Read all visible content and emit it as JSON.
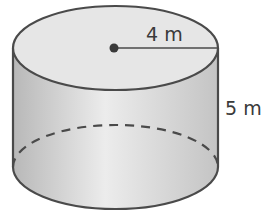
{
  "figure": {
    "shape": "cylinder",
    "radius_label": "4 m",
    "height_label": "5 m",
    "colors": {
      "outline": "#4a4a4a",
      "top_fill": "#e6e6e6",
      "side_light": "#ececec",
      "side_dark": "#bdbdbd"
    }
  }
}
